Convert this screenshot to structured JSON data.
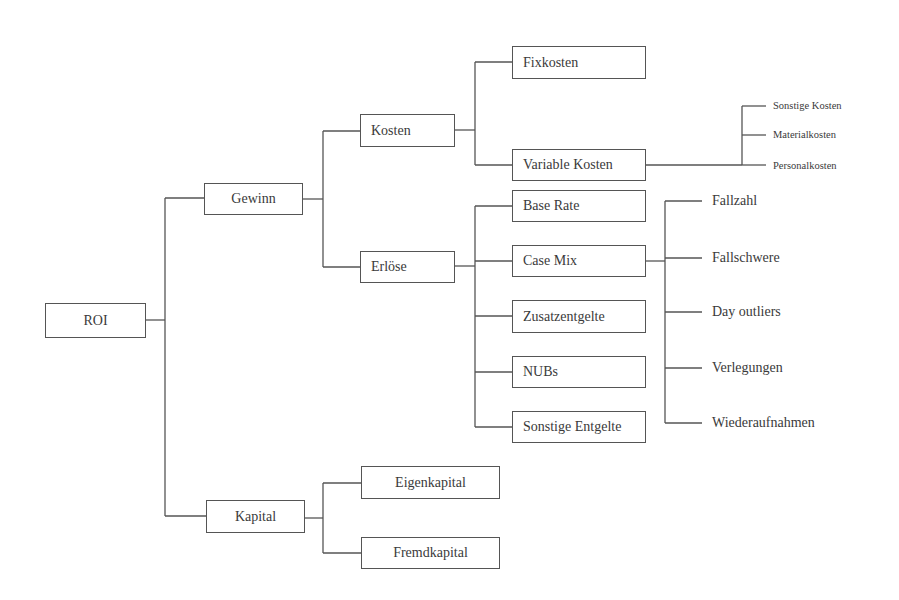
{
  "diagram": {
    "root": {
      "label": "ROI"
    },
    "level1": {
      "gewinn": {
        "label": "Gewinn"
      },
      "kapital": {
        "label": "Kapital"
      }
    },
    "level2": {
      "kosten": {
        "label": "Kosten"
      },
      "erloese": {
        "label": "Erlöse"
      },
      "eigenkapital": {
        "label": "Eigenkapital"
      },
      "fremdkapital": {
        "label": "Fremdkapital"
      }
    },
    "kosten_children": [
      {
        "label": "Fixkosten"
      },
      {
        "label": "Variable Kosten"
      }
    ],
    "variable_kosten_children": [
      {
        "label": "Sonstige Kosten"
      },
      {
        "label": "Materialkosten"
      },
      {
        "label": "Personalkosten"
      }
    ],
    "erloese_children": [
      {
        "label": "Base Rate"
      },
      {
        "label": "Case Mix"
      },
      {
        "label": "Zusatzentgelte"
      },
      {
        "label": "NUBs"
      },
      {
        "label": "Sonstige Entgelte"
      }
    ],
    "case_mix_children": [
      {
        "label": "Fallzahl"
      },
      {
        "label": "Fallschwere"
      },
      {
        "label": "Day outliers"
      },
      {
        "label": "Verlegungen"
      },
      {
        "label": "Wiederaufnahmen"
      }
    ],
    "colors": {
      "line": "#555555",
      "text": "#3a3a3a",
      "background": "#ffffff"
    }
  }
}
